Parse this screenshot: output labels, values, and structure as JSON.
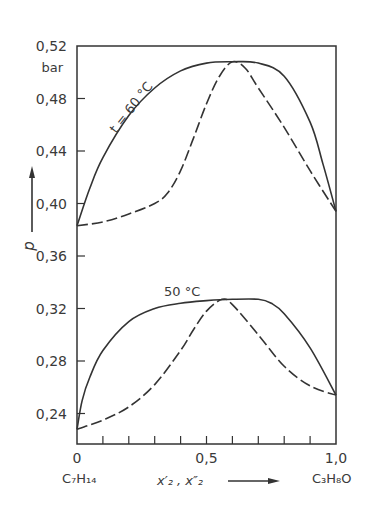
{
  "chart_data": {
    "type": "line",
    "title": "",
    "xlabel": "x2', x2''",
    "ylabel": "p",
    "yunit": "bar",
    "xlim": [
      0,
      1.0
    ],
    "ylim": [
      0.22,
      0.52
    ],
    "x_tick_labels": [
      "0",
      "0,5",
      "1,0"
    ],
    "x_minor_ticks": [
      0.1,
      0.2,
      0.3,
      0.4,
      0.5,
      0.6,
      0.7,
      0.8,
      0.9
    ],
    "y_tick_labels": [
      "0,52",
      "0,48",
      "0,44",
      "0,40",
      "0,36",
      "0,32",
      "0,28",
      "0,24"
    ],
    "y_ticks": [
      0.52,
      0.48,
      0.44,
      0.4,
      0.36,
      0.32,
      0.28,
      0.24
    ],
    "x_left_component": "C7H14",
    "x_right_component": "C3H8O",
    "grid": false,
    "annotations": [
      "t = 60 °C",
      "50 °C"
    ],
    "series": [
      {
        "name": "60 °C liquid (bubble, x2')",
        "style": "solid",
        "x": [
          0,
          0.05,
          0.1,
          0.2,
          0.3,
          0.4,
          0.5,
          0.6,
          0.7,
          0.8,
          0.9,
          0.95,
          1.0
        ],
        "y": [
          0.383,
          0.412,
          0.435,
          0.467,
          0.488,
          0.501,
          0.507,
          0.508,
          0.507,
          0.497,
          0.462,
          0.43,
          0.394
        ]
      },
      {
        "name": "60 °C vapour (dew, x2'')",
        "style": "dashed",
        "x": [
          0,
          0.1,
          0.2,
          0.3,
          0.35,
          0.4,
          0.45,
          0.5,
          0.55,
          0.6,
          0.65,
          0.7,
          0.8,
          0.9,
          1.0
        ],
        "y": [
          0.383,
          0.386,
          0.392,
          0.4,
          0.408,
          0.425,
          0.45,
          0.476,
          0.497,
          0.508,
          0.503,
          0.488,
          0.458,
          0.425,
          0.394
        ]
      },
      {
        "name": "50 °C liquid (bubble, x2')",
        "style": "solid",
        "x": [
          0,
          0.02,
          0.05,
          0.1,
          0.2,
          0.3,
          0.4,
          0.5,
          0.6,
          0.7,
          0.75,
          0.8,
          0.9,
          1.0
        ],
        "y": [
          0.228,
          0.25,
          0.268,
          0.288,
          0.31,
          0.32,
          0.324,
          0.326,
          0.327,
          0.327,
          0.324,
          0.316,
          0.29,
          0.254
        ]
      },
      {
        "name": "50 °C vapour (dew, x2'')",
        "style": "dashed",
        "x": [
          0,
          0.1,
          0.2,
          0.3,
          0.4,
          0.45,
          0.5,
          0.56,
          0.6,
          0.7,
          0.8,
          0.9,
          1.0
        ],
        "y": [
          0.228,
          0.235,
          0.245,
          0.262,
          0.288,
          0.304,
          0.318,
          0.327,
          0.323,
          0.3,
          0.276,
          0.261,
          0.254
        ]
      }
    ]
  },
  "labels": {
    "y_unit": "bar",
    "y_axis": "p",
    "x_axis": "x′₂ , x″₂",
    "left_component": "C₇H₁₄",
    "right_component": "C₃H₈O",
    "anno_60": "t = 60 °C",
    "anno_50": "50 °C"
  }
}
